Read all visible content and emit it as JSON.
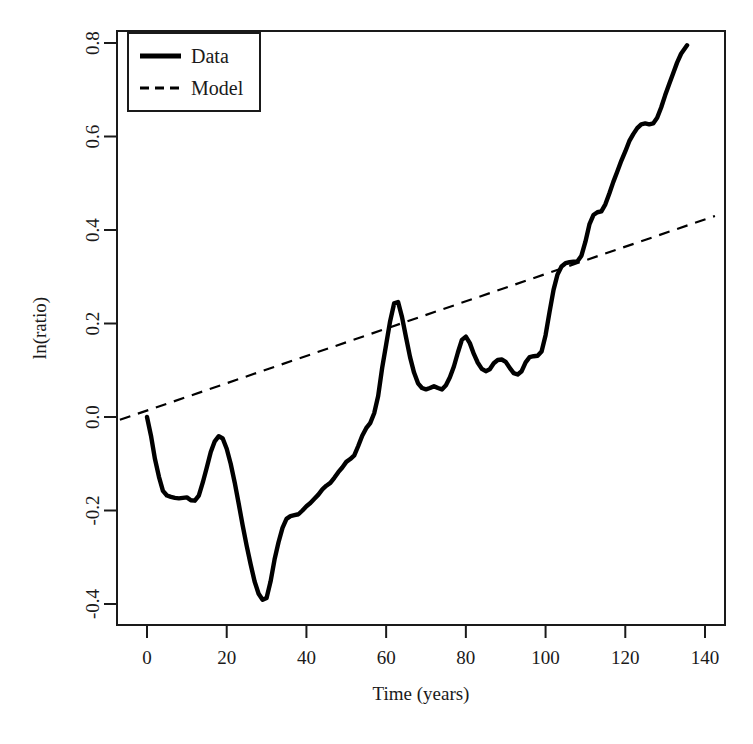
{
  "chart_data": {
    "type": "line",
    "title": "",
    "xlabel": "Time (years)",
    "ylabel": "ln(ratio)",
    "xlim": [
      -7,
      145
    ],
    "ylim": [
      -0.44,
      0.83
    ],
    "xticks": [
      0,
      20,
      40,
      60,
      80,
      100,
      120,
      140
    ],
    "xtick_labels": [
      "0",
      "20",
      "40",
      "60",
      "80",
      "100",
      "120",
      "140"
    ],
    "yticks": [
      -0.4,
      -0.2,
      0.0,
      0.2,
      0.4,
      0.6,
      0.8
    ],
    "ytick_labels": [
      "-0.4",
      "-0.2",
      "0.0",
      "0.2",
      "0.4",
      "0.6",
      "0.8"
    ],
    "grid": false,
    "legend_position": "top-left",
    "legend_entries": [
      {
        "label": "Data",
        "style": "solid",
        "color": "#000000",
        "width": 4
      },
      {
        "label": "Model",
        "style": "dashed",
        "color": "#000000",
        "width": 2
      }
    ],
    "series": [
      {
        "name": "Data",
        "style": "solid",
        "color": "#000000",
        "x": [
          0,
          1,
          2,
          3,
          4,
          5,
          6,
          7,
          8,
          9,
          10,
          11,
          12,
          13,
          14,
          15,
          16,
          17,
          18,
          19,
          20,
          21,
          22,
          23,
          24,
          25,
          26,
          27,
          28,
          29,
          30,
          31,
          32,
          33,
          34,
          35,
          36,
          37,
          38,
          39,
          40,
          41,
          42,
          43,
          44,
          45,
          46,
          47,
          48,
          49,
          50,
          51,
          52,
          53,
          54,
          55,
          56,
          57,
          58,
          59,
          60,
          61,
          62,
          63,
          64,
          65,
          66,
          67,
          68,
          69,
          70,
          71,
          72,
          73,
          74,
          75,
          76,
          77,
          78,
          79,
          80,
          81,
          82,
          83,
          84,
          85,
          86,
          87,
          88,
          89,
          90,
          91,
          92,
          93,
          94,
          95,
          96,
          97,
          98,
          99,
          100,
          101,
          102,
          103,
          104,
          105,
          106,
          107,
          108,
          109,
          110,
          111,
          112,
          113,
          114,
          115,
          116,
          117,
          118,
          119,
          120,
          121,
          122,
          123,
          124,
          125,
          126,
          127,
          128,
          129,
          130,
          131,
          132,
          133,
          134,
          135.5
        ],
        "y": [
          0.0,
          -0.04,
          -0.09,
          -0.128,
          -0.158,
          -0.168,
          -0.171,
          -0.173,
          -0.174,
          -0.173,
          -0.172,
          -0.178,
          -0.179,
          -0.168,
          -0.14,
          -0.108,
          -0.075,
          -0.052,
          -0.041,
          -0.046,
          -0.068,
          -0.1,
          -0.14,
          -0.185,
          -0.232,
          -0.275,
          -0.315,
          -0.352,
          -0.378,
          -0.391,
          -0.387,
          -0.352,
          -0.305,
          -0.268,
          -0.237,
          -0.218,
          -0.212,
          -0.21,
          -0.208,
          -0.2,
          -0.191,
          -0.184,
          -0.175,
          -0.166,
          -0.155,
          -0.147,
          -0.141,
          -0.13,
          -0.118,
          -0.108,
          -0.096,
          -0.09,
          -0.082,
          -0.062,
          -0.04,
          -0.024,
          -0.013,
          0.008,
          0.045,
          0.105,
          0.155,
          0.205,
          0.243,
          0.246,
          0.213,
          0.17,
          0.128,
          0.095,
          0.072,
          0.062,
          0.059,
          0.062,
          0.066,
          0.062,
          0.059,
          0.068,
          0.085,
          0.108,
          0.138,
          0.165,
          0.172,
          0.158,
          0.135,
          0.116,
          0.103,
          0.098,
          0.102,
          0.115,
          0.122,
          0.123,
          0.118,
          0.105,
          0.094,
          0.091,
          0.098,
          0.117,
          0.128,
          0.13,
          0.131,
          0.14,
          0.175,
          0.225,
          0.272,
          0.305,
          0.322,
          0.329,
          0.331,
          0.332,
          0.333,
          0.345,
          0.375,
          0.412,
          0.432,
          0.438,
          0.44,
          0.455,
          0.478,
          0.503,
          0.525,
          0.548,
          0.568,
          0.59,
          0.605,
          0.618,
          0.626,
          0.628,
          0.626,
          0.628,
          0.64,
          0.662,
          0.688,
          0.712,
          0.735,
          0.758,
          0.777,
          0.795
        ]
      },
      {
        "name": "Model",
        "style": "dashed",
        "color": "#000000",
        "x": [
          -6.8,
          142.5
        ],
        "y": [
          -0.006,
          0.43
        ]
      }
    ]
  },
  "axes": {
    "x_axis_label": "Time (years)",
    "y_axis_label": "ln(ratio)"
  },
  "legend": {
    "items": [
      {
        "label": "Data"
      },
      {
        "label": "Model"
      }
    ]
  }
}
